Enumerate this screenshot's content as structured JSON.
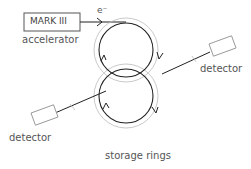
{
  "diagram": {
    "accelerator_box_label": "MARK III",
    "accelerator_label": "accelerator",
    "beam_label": "e⁻",
    "detector_right_label": "detector",
    "detector_left_label": "detector",
    "rings_label": "storage rings"
  },
  "colors": {
    "line": "#222222",
    "outer_ring": "#b5b5b5",
    "box_border": "#555555",
    "detector_border": "#999999",
    "text": "#555555"
  }
}
